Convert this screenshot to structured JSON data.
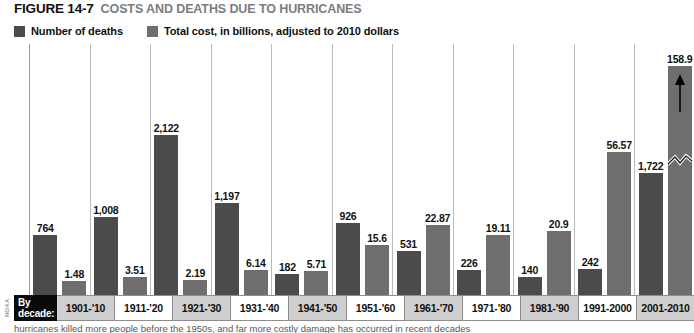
{
  "figure": {
    "number": "FIGURE 14-7",
    "title": "COSTS AND DEATHS DUE TO HURRICANES",
    "credit": "NOAA",
    "axis_label_line1": "By",
    "axis_label_line2": "decade:",
    "caption": "hurricanes killed more people before the 1950s, and far more costly damage has occurred in recent decades"
  },
  "legend": {
    "items": [
      {
        "label": "Number of deaths",
        "color": "#4b4b4b",
        "swatch_name": "deaths-swatch"
      },
      {
        "label": "Total cost, in billions, adjusted to 2010 dollars",
        "color": "#6e6e6e",
        "swatch_name": "cost-swatch"
      }
    ]
  },
  "chart_data": {
    "type": "bar",
    "title": "COSTS AND DEATHS DUE TO HURRICANES",
    "xlabel": "By decade:",
    "ylabel": "",
    "grid": false,
    "legend_position": "top-left",
    "categories": [
      "1901-'10",
      "1911-'20",
      "1921-'30",
      "1931-'40",
      "1941-'50",
      "1951-'60",
      "1961-'70",
      "1971-'80",
      "1981-'90",
      "1991-2000",
      "2001-2010"
    ],
    "series": [
      {
        "name": "Number of deaths",
        "color": "#4b4b4b",
        "values": [
          764,
          1008,
          2122,
          1197,
          182,
          926,
          531,
          226,
          140,
          242,
          1722
        ],
        "labels": [
          "764",
          "1,008",
          "2,122",
          "1,197",
          "182",
          "926",
          "531",
          "226",
          "140",
          "242",
          "1,722"
        ]
      },
      {
        "name": "Total cost, in billions, adjusted to 2010 dollars",
        "color": "#6e6e6e",
        "values": [
          1.48,
          3.51,
          2.19,
          6.14,
          5.71,
          15.6,
          22.87,
          19.11,
          20.9,
          56.57,
          158.9
        ],
        "labels": [
          "1.48",
          "3.51",
          "2.19",
          "6.14",
          "5.71",
          "15.6",
          "22.87",
          "19.11",
          "20.9",
          "56.57",
          "158.9"
        ],
        "truncated_index": 10,
        "truncated_note": "bar broken with zigzag and arrow to indicate off-scale value"
      }
    ],
    "annotations": [
      {
        "type": "axis-break",
        "on": "2001-2010 total cost bar",
        "symbol": "zigzag"
      },
      {
        "type": "arrow",
        "on": "2001-2010 total cost bar",
        "direction": "up"
      }
    ]
  },
  "bars": [
    {
      "decade": "1901-'10",
      "deaths": "764",
      "deaths_h": 60,
      "cost": "1.48",
      "cost_h": 14,
      "shaded": true,
      "truncated": false
    },
    {
      "decade": "1911-'20",
      "deaths": "1,008",
      "deaths_h": 78,
      "cost": "3.51",
      "cost_h": 18,
      "shaded": false,
      "truncated": false
    },
    {
      "decade": "1921-'30",
      "deaths": "2,122",
      "deaths_h": 160,
      "cost": "2.19",
      "cost_h": 15,
      "shaded": true,
      "truncated": false
    },
    {
      "decade": "1931-'40",
      "deaths": "1,197",
      "deaths_h": 92,
      "cost": "6.14",
      "cost_h": 25,
      "shaded": false,
      "truncated": false
    },
    {
      "decade": "1941-'50",
      "deaths": "182",
      "deaths_h": 21,
      "cost": "5.71",
      "cost_h": 24,
      "shaded": true,
      "truncated": false
    },
    {
      "decade": "1951-'60",
      "deaths": "926",
      "deaths_h": 72,
      "cost": "15.6",
      "cost_h": 50,
      "shaded": false,
      "truncated": false
    },
    {
      "decade": "1961-'70",
      "deaths": "531",
      "deaths_h": 44,
      "cost": "22.87",
      "cost_h": 70,
      "shaded": true,
      "truncated": false
    },
    {
      "decade": "1971-'80",
      "deaths": "226",
      "deaths_h": 25,
      "cost": "19.11",
      "cost_h": 60,
      "shaded": false,
      "truncated": false
    },
    {
      "decade": "1981-'90",
      "deaths": "140",
      "deaths_h": 18,
      "cost": "20.9",
      "cost_h": 64,
      "shaded": true,
      "truncated": false
    },
    {
      "decade": "1991-2000",
      "deaths": "242",
      "deaths_h": 26,
      "cost": "56.57",
      "cost_h": 143,
      "shaded": false,
      "truncated": false
    },
    {
      "decade": "2001-2010",
      "deaths": "1,722",
      "deaths_h": 122,
      "cost": "158.9",
      "cost_h": 229,
      "shaded": true,
      "truncated": true
    }
  ]
}
